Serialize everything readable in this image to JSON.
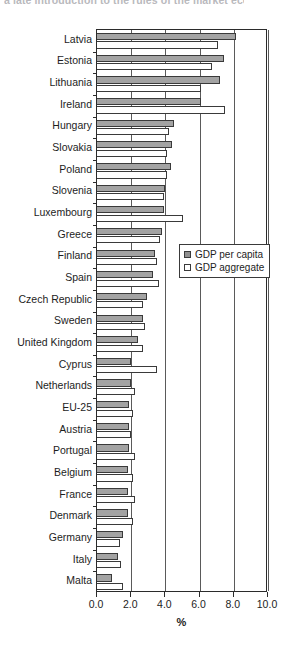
{
  "caption_fragment": "a late introduction to the rules of the market economy.",
  "chart_data": {
    "type": "bar",
    "orientation": "horizontal",
    "title": "",
    "subtitle": "",
    "xlabel": "%",
    "ylabel": "",
    "xlim": [
      0.0,
      10.0
    ],
    "xticks": [
      0.0,
      2.0,
      4.0,
      6.0,
      8.0,
      10.0
    ],
    "xtick_labels": [
      "0.0",
      "2.0",
      "4.0",
      "6.0",
      "8.0",
      "10.0"
    ],
    "grid": "vertical",
    "legend_position": "center-right",
    "categories": [
      "Latvia",
      "Estonia",
      "Lithuania",
      "Ireland",
      "Hungary",
      "Slovakia",
      "Poland",
      "Slovenia",
      "Luxembourg",
      "Greece",
      "Finland",
      "Spain",
      "Czech Republic",
      "Sweden",
      "United Kingdom",
      "Cyprus",
      "Netherlands",
      "EU-25",
      "Austria",
      "Portugal",
      "Belgium",
      "France",
      "Denmark",
      "Germany",
      "Italy",
      "Malta"
    ],
    "series": [
      {
        "name": "GDP per capita",
        "color": "#a3a3a3",
        "values": [
          8.1,
          7.4,
          7.2,
          6.1,
          4.5,
          4.4,
          4.3,
          4.0,
          3.9,
          3.8,
          3.4,
          3.3,
          2.9,
          2.7,
          2.4,
          2.0,
          2.0,
          1.9,
          1.9,
          1.9,
          1.8,
          1.8,
          1.8,
          1.5,
          1.2,
          0.9
        ]
      },
      {
        "name": "GDP aggregate",
        "color": "#ffffff",
        "values": [
          7.1,
          6.7,
          6.1,
          7.5,
          4.2,
          4.1,
          4.1,
          3.9,
          5.0,
          3.7,
          3.5,
          3.6,
          2.7,
          2.8,
          2.7,
          3.5,
          2.2,
          2.1,
          2.0,
          2.2,
          2.1,
          2.2,
          2.1,
          1.35,
          1.4,
          1.5
        ]
      }
    ]
  },
  "legend": {
    "items": [
      {
        "label": "GDP per capita",
        "swatch": "filled-gray-square-icon"
      },
      {
        "label": "GDP aggregate",
        "swatch": "empty-white-square-icon"
      }
    ]
  }
}
